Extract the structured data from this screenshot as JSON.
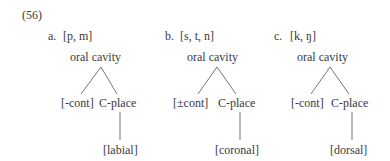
{
  "example_number": "(56)",
  "trees": [
    {
      "label": "a.",
      "segments": "[p, m]",
      "root": "oral  cavity",
      "left_child": "[-cont]",
      "right_child": "C-place",
      "terminal": "[labial]"
    },
    {
      "label": "b.",
      "segments": "[s, t, n]",
      "root": "oral  cavity",
      "left_child": "[±cont]",
      "right_child": "C-place",
      "terminal": "[coronal]"
    },
    {
      "label": "c.",
      "segments": "[k, ŋ]",
      "root": "oral  cavity",
      "left_child": "[-cont]",
      "right_child": "C-place",
      "terminal": "[dorsal]"
    }
  ]
}
